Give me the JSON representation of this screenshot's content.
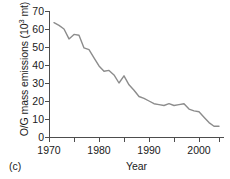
{
  "panel_label": "(c)",
  "chart_data": {
    "type": "line",
    "title": "",
    "xlabel": "Year",
    "ylabel": "O/G mass emissions (10^3 mt)",
    "ylabel_prefix": "O/G mass emissions (10",
    "ylabel_exponent": "3",
    "ylabel_suffix": " mt)",
    "xlim": [
      1970,
      2004.8
    ],
    "ylim": [
      0,
      70
    ],
    "yticks": [
      0,
      10,
      20,
      30,
      40,
      50,
      60,
      70
    ],
    "ytick_labels": [
      "0",
      "10",
      "20",
      "30",
      "40",
      "50",
      "60",
      "70"
    ],
    "xticks": [
      1970,
      1975,
      1980,
      1985,
      1990,
      1995,
      2000,
      2004
    ],
    "xtick_labels": [
      "1970",
      "",
      "1980",
      "",
      "1990",
      "",
      "2000",
      ""
    ],
    "xtick_major": [
      1970,
      1980,
      1990,
      2000
    ],
    "grid": false,
    "legend": false,
    "line_color": "#8c8c8c",
    "axis_color": "#4d4d4d",
    "series": [
      {
        "name": "O/G mass emissions",
        "x": [
          1971,
          1972,
          1973,
          1974,
          1975,
          1976,
          1977,
          1978,
          1979,
          1980,
          1981,
          1982,
          1983,
          1984,
          1985,
          1986,
          1987,
          1988,
          1989,
          1990,
          1991,
          1992,
          1993,
          1994,
          1995,
          1996,
          1997,
          1998,
          1999,
          2000,
          2001,
          2002,
          2003,
          2004
        ],
        "values": [
          63.5,
          62.0,
          60.0,
          54.5,
          57.0,
          56.5,
          49.5,
          48.5,
          44.0,
          39.5,
          36.5,
          37.0,
          34.5,
          30.0,
          34.0,
          29.0,
          26.0,
          22.5,
          21.5,
          20.0,
          18.5,
          18.0,
          17.5,
          18.5,
          17.5,
          18.0,
          18.5,
          15.5,
          14.5,
          14.0,
          11.0,
          8.0,
          6.0,
          6.0
        ]
      }
    ]
  }
}
